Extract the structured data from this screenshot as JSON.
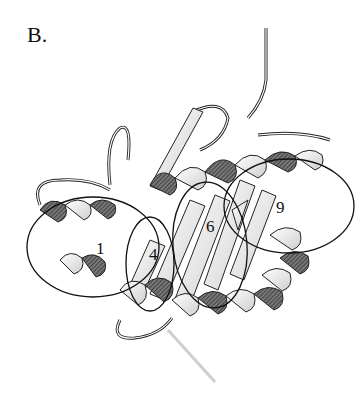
{
  "figure": {
    "panel_label": "B.",
    "type": "protein ribbon diagram",
    "regions": [
      {
        "label": "1",
        "cx": 93,
        "cy": 247,
        "rx": 66,
        "ry": 50
      },
      {
        "label": "4",
        "cx": 150,
        "cy": 264,
        "rx": 24,
        "ry": 47
      },
      {
        "label": "6",
        "cx": 210,
        "cy": 245,
        "rx": 37,
        "ry": 63
      },
      {
        "label": "9",
        "cx": 289,
        "cy": 206,
        "rx": 65,
        "ry": 47
      }
    ],
    "colors": {
      "background": "#ffffff",
      "outline": "#111111",
      "ribbon_light": "#f2f2f2",
      "ribbon_dark": "#555555",
      "faint_trace": "#cccccc"
    }
  }
}
